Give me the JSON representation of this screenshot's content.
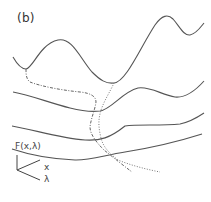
{
  "figure": {
    "panel_label": "(b)",
    "axes": {
      "vertical_label": "F(x,λ)",
      "x_label": "x",
      "lambda_label": "λ"
    },
    "colors": {
      "curve": "#555555",
      "dash_dot": "#666666",
      "dotted": "#777777",
      "background": "#ffffff"
    },
    "curves": [
      {
        "name": "profile-1",
        "style": "solid",
        "description": "top profile: double-well with deep left basin and high right peak"
      },
      {
        "name": "profile-2",
        "style": "solid",
        "description": "second profile: shallow double-well"
      },
      {
        "name": "profile-3",
        "style": "solid",
        "description": "third profile: nearly flat with slight wells"
      },
      {
        "name": "profile-4",
        "style": "solid",
        "description": "bottom profile: monotone slope"
      },
      {
        "name": "minimum-path-dashdot",
        "style": "dash-dot",
        "description": "trajectory of left minimum across λ"
      },
      {
        "name": "minimum-path-dotted",
        "style": "dotted",
        "description": "trajectory of right minimum across λ"
      }
    ]
  }
}
